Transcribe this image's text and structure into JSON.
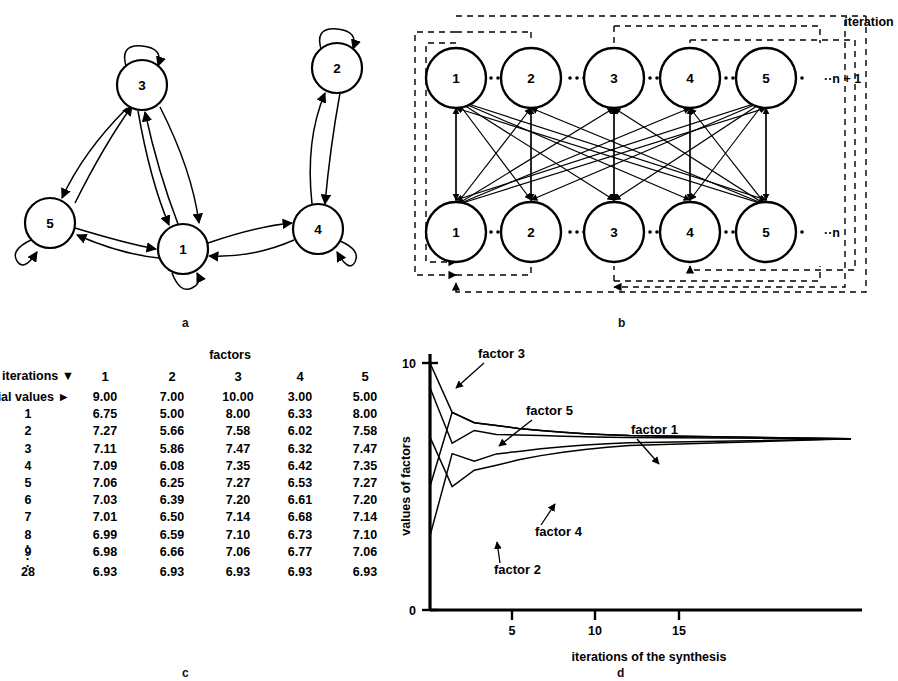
{
  "figure": {
    "top_caption": "",
    "panel_labels": {
      "a": "a",
      "b": "b",
      "c": "c",
      "d": "d"
    }
  },
  "panel_a": {
    "title": "state transition graph",
    "nodes": [
      {
        "id": "1",
        "label": "1",
        "cx": 183,
        "cy": 249,
        "r": 25,
        "self_loop": "bottom"
      },
      {
        "id": "2",
        "label": "2",
        "cx": 337,
        "cy": 68,
        "r": 25,
        "self_loop": "top"
      },
      {
        "id": "3",
        "label": "3",
        "cx": 142,
        "cy": 85,
        "r": 25,
        "self_loop": "top"
      },
      {
        "id": "4",
        "label": "4",
        "cx": 318,
        "cy": 229,
        "r": 25,
        "self_loop": "right"
      },
      {
        "id": "5",
        "label": "5",
        "cx": 50,
        "cy": 223,
        "r": 25,
        "self_loop": "left"
      }
    ],
    "edges": [
      {
        "from": "3",
        "to": "5"
      },
      {
        "from": "5",
        "to": "3"
      },
      {
        "from": "3",
        "to": "1"
      },
      {
        "from": "1",
        "to": "3"
      },
      {
        "from": "5",
        "to": "1"
      },
      {
        "from": "1",
        "to": "5"
      },
      {
        "from": "1",
        "to": "4"
      },
      {
        "from": "4",
        "to": "1"
      },
      {
        "from": "4",
        "to": "2"
      },
      {
        "from": "2",
        "to": "4"
      }
    ]
  },
  "panel_b": {
    "title": "iteration unrolled",
    "iteration_label": "iteration",
    "row_labels": {
      "top": "··n + 1",
      "bottom": "··n"
    },
    "top_nodes": [
      "1",
      "2",
      "3",
      "4",
      "5"
    ],
    "bottom_nodes": [
      "1",
      "2",
      "3",
      "4",
      "5"
    ],
    "dots_separator": "····"
  },
  "panel_c": {
    "header_group": "factors",
    "row_header_label": "iterations ▼",
    "initial_row_label": "itial values  ►",
    "columns": [
      "1",
      "2",
      "3",
      "4",
      "5"
    ],
    "vertical_ellipsis": "·",
    "rows": [
      {
        "label": "itial values",
        "is_initial": true,
        "values": [
          "9.00",
          "7.00",
          "10.00",
          "3.00",
          "5.00"
        ]
      },
      {
        "label": "1",
        "values": [
          "6.75",
          "5.00",
          "8.00",
          "6.33",
          "8.00"
        ]
      },
      {
        "label": "2",
        "values": [
          "7.27",
          "5.66",
          "7.58",
          "6.02",
          "7.58"
        ]
      },
      {
        "label": "3",
        "values": [
          "7.11",
          "5.86",
          "7.47",
          "6.32",
          "7.47"
        ]
      },
      {
        "label": "4",
        "values": [
          "7.09",
          "6.08",
          "7.35",
          "6.42",
          "7.35"
        ]
      },
      {
        "label": "5",
        "values": [
          "7.06",
          "6.25",
          "7.27",
          "6.53",
          "7.27"
        ]
      },
      {
        "label": "6",
        "values": [
          "7.03",
          "6.39",
          "7.20",
          "6.61",
          "7.20"
        ]
      },
      {
        "label": "7",
        "values": [
          "7.01",
          "6.50",
          "7.14",
          "6.68",
          "7.14"
        ]
      },
      {
        "label": "8",
        "values": [
          "6.99",
          "6.59",
          "7.10",
          "6.73",
          "7.10"
        ]
      },
      {
        "label": "9",
        "values": [
          "6.98",
          "6.66",
          "7.06",
          "6.77",
          "7.06"
        ]
      },
      {
        "label": "28",
        "values": [
          "6.93",
          "6.93",
          "6.93",
          "6.93",
          "6.93"
        ]
      }
    ]
  },
  "chart_data": {
    "type": "line",
    "title": "",
    "xlabel": "iterations of the synthesis",
    "ylabel": "values of factors",
    "xlim": [
      0,
      19.5
    ],
    "ylim": [
      0,
      10.4
    ],
    "xticks": [
      5,
      10,
      15
    ],
    "xticklabels": [
      "5",
      "10",
      "15"
    ],
    "yticks": [
      0,
      10
    ],
    "yticklabels": [
      "0",
      "10"
    ],
    "grid": false,
    "legend": "inline-annotations",
    "x": [
      0,
      1,
      2,
      3,
      4,
      5,
      6,
      7,
      8,
      9,
      19
    ],
    "series": [
      {
        "name": "factor 1",
        "label": "factor 1",
        "values": [
          9.0,
          6.75,
          7.27,
          7.11,
          7.09,
          7.06,
          7.03,
          7.01,
          6.99,
          6.98,
          6.93
        ]
      },
      {
        "name": "factor 2",
        "label": "factor 2",
        "values": [
          7.0,
          5.0,
          5.66,
          5.86,
          6.08,
          6.25,
          6.39,
          6.5,
          6.59,
          6.66,
          6.93
        ]
      },
      {
        "name": "factor 3",
        "label": "factor 3",
        "values": [
          10.0,
          8.0,
          7.58,
          7.47,
          7.35,
          7.27,
          7.2,
          7.14,
          7.1,
          7.06,
          6.93
        ]
      },
      {
        "name": "factor 4",
        "label": "factor 4",
        "values": [
          3.0,
          6.33,
          6.02,
          6.32,
          6.42,
          6.53,
          6.61,
          6.68,
          6.73,
          6.77,
          6.93
        ]
      },
      {
        "name": "factor 5",
        "label": "factor 5",
        "values": [
          5.0,
          8.0,
          7.58,
          7.47,
          7.35,
          7.27,
          7.2,
          7.14,
          7.1,
          7.06,
          6.93
        ]
      }
    ],
    "annotations": [
      {
        "text": "factor 3",
        "tx": 82,
        "ty": 22,
        "ax": 60,
        "ay": 52
      },
      {
        "text": "factor 5",
        "tx": 130,
        "ty": 79,
        "ax": 103,
        "ay": 110
      },
      {
        "text": "factor 1",
        "tx": 235,
        "ty": 98,
        "ax": 263,
        "ay": 128
      },
      {
        "text": "factor 4",
        "tx": 139,
        "ty": 200,
        "ax": 159,
        "ay": 168
      },
      {
        "text": "factor 2",
        "tx": 98,
        "ty": 238,
        "ax": 101,
        "ay": 206
      }
    ]
  }
}
